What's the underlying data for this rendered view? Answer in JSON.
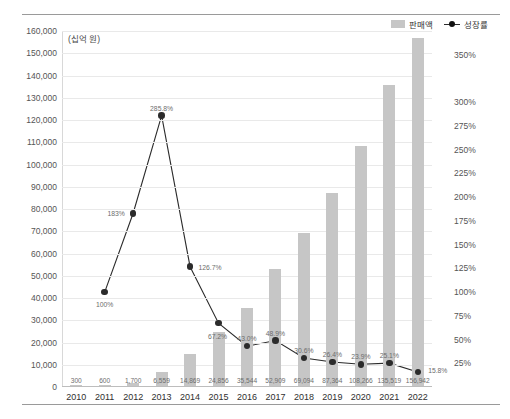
{
  "legend": {
    "bar_label": "판매액",
    "line_label": "성장률",
    "bar_color": "#c6c6c6",
    "line_color": "#2b2b2b"
  },
  "unit_label": "(십억 원)",
  "chart_data": {
    "type": "bar",
    "title": "",
    "xlabel": "",
    "ylabel": "",
    "grid": true,
    "legend_position": "top-right",
    "categories": [
      "2010",
      "2011",
      "2012",
      "2013",
      "2014",
      "2015",
      "2016",
      "2017",
      "2018",
      "2019",
      "2020",
      "2021",
      "2022"
    ],
    "series": [
      {
        "name": "판매액",
        "type": "bar",
        "axis": "left",
        "unit": "십억 원",
        "values": [
          300,
          600,
          1700,
          6559,
          14869,
          24856,
          35544,
          52909,
          69094,
          87364,
          108266,
          135519,
          156942
        ],
        "value_labels": [
          "300",
          "600",
          "1,700",
          "6,559",
          "14,869",
          "24,856",
          "35,544",
          "52,909",
          "69,094",
          "87,364",
          "108,266",
          "135,519",
          "156,942"
        ]
      },
      {
        "name": "성장률",
        "type": "line",
        "axis": "right",
        "unit": "%",
        "values": [
          null,
          100,
          183,
          285.8,
          126.7,
          67.2,
          43.0,
          48.9,
          30.6,
          26.4,
          23.9,
          25.1,
          15.8
        ],
        "value_labels": [
          "",
          "100%",
          "183%",
          "285.8%",
          "126.7%",
          "67.2%",
          "43.0%",
          "48.9%",
          "30.6%",
          "26.4%",
          "23.9%",
          "25.1%",
          "15.8%"
        ]
      }
    ],
    "left_axis": {
      "min": 0,
      "max": 160000,
      "step": 10000,
      "ticks": [
        "0",
        "10,000",
        "20,000",
        "30,000",
        "40,000",
        "50,000",
        "60,000",
        "70,000",
        "80,000",
        "90,000",
        "100,000",
        "110,000",
        "120,000",
        "130,000",
        "140,000",
        "150,000",
        "160,000"
      ]
    },
    "right_axis": {
      "min": 0,
      "max": 375,
      "step": 25,
      "ticks": [
        "25%",
        "50%",
        "75%",
        "100%",
        "125%",
        "150%",
        "175%",
        "200%",
        "225%",
        "250%",
        "275%",
        "300%",
        "350%"
      ],
      "tick_values": [
        25,
        50,
        75,
        100,
        125,
        150,
        175,
        200,
        225,
        250,
        275,
        300,
        350
      ]
    }
  }
}
